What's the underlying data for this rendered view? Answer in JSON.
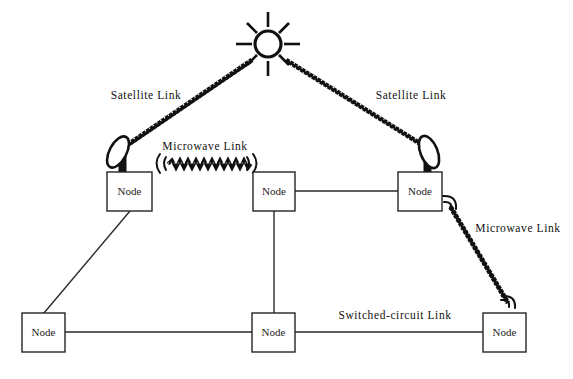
{
  "diagram": {
    "background_color": "#ffffff",
    "line_color": "#2a2a2a",
    "ink_color": "#111111",
    "width": 573,
    "height": 379
  },
  "satellite": {
    "name": "satellite",
    "center_x": 268,
    "center_y": 44,
    "radius": 13,
    "spoke_count": 8
  },
  "nodes": [
    {
      "id": "node-upper-left",
      "label": "Node",
      "x": 107,
      "y": 172,
      "w": 45,
      "h": 39,
      "has_dish": true,
      "dish_side": "left"
    },
    {
      "id": "node-upper-middle",
      "label": "Node",
      "x": 253,
      "y": 172,
      "w": 42,
      "h": 39,
      "has_dish": false,
      "dish_side": ""
    },
    {
      "id": "node-upper-right",
      "label": "Node",
      "x": 398,
      "y": 172,
      "w": 44,
      "h": 39,
      "has_dish": true,
      "dish_side": "right"
    },
    {
      "id": "node-lower-left",
      "label": "Node",
      "x": 22,
      "y": 313,
      "w": 43,
      "h": 39,
      "has_dish": false,
      "dish_side": ""
    },
    {
      "id": "node-lower-middle",
      "label": "Node",
      "x": 252,
      "y": 313,
      "w": 43,
      "h": 39,
      "has_dish": false,
      "dish_side": ""
    },
    {
      "id": "node-lower-right",
      "label": "Node",
      "x": 483,
      "y": 313,
      "w": 43,
      "h": 39,
      "has_dish": false,
      "dish_side": ""
    }
  ],
  "labels": {
    "satellite_link_left": "Satellite Link",
    "satellite_link_right": "Satellite Link",
    "microwave_link_top": "Microwave Link",
    "microwave_link_right": "Microwave Link",
    "switched_circuit_link": "Switched-circuit Link"
  },
  "label_positions": {
    "satellite_link_left": {
      "x": 146,
      "y": 96
    },
    "satellite_link_right": {
      "x": 411,
      "y": 96
    },
    "microwave_link_top": {
      "x": 205,
      "y": 147
    },
    "microwave_link_right": {
      "x": 518,
      "y": 229
    },
    "switched_circuit_link": {
      "x": 395,
      "y": 316
    }
  },
  "links": [
    {
      "id": "link-satellite-left",
      "kind": "satellite",
      "from": "node-upper-left",
      "to": "satellite"
    },
    {
      "id": "link-satellite-right",
      "kind": "satellite",
      "from": "satellite",
      "to": "node-upper-right"
    },
    {
      "id": "link-microwave-top",
      "kind": "microwave",
      "from": "node-upper-left",
      "to": "node-upper-middle"
    },
    {
      "id": "link-microwave-right",
      "kind": "microwave",
      "from": "node-upper-right",
      "to": "node-lower-right"
    },
    {
      "id": "link-wire-mid-right",
      "kind": "wire",
      "from": "node-upper-middle",
      "to": "node-upper-right"
    },
    {
      "id": "link-wire-ul-ll",
      "kind": "wire",
      "from": "node-upper-left",
      "to": "node-lower-left"
    },
    {
      "id": "link-wire-um-lm",
      "kind": "wire",
      "from": "node-upper-middle",
      "to": "node-lower-middle"
    },
    {
      "id": "link-wire-ll-lm",
      "kind": "wire",
      "from": "node-lower-left",
      "to": "node-lower-middle"
    },
    {
      "id": "link-switched",
      "kind": "switched-circuit",
      "from": "node-lower-middle",
      "to": "node-lower-right"
    }
  ]
}
